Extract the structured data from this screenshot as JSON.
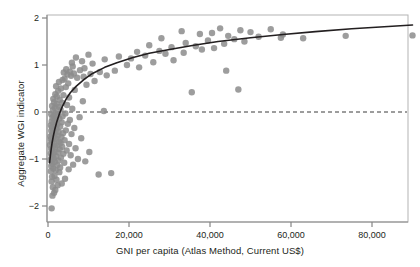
{
  "chart_data": {
    "type": "scatter",
    "title": "",
    "xlabel": "GNI per capita (Atlas Method, Current US$)",
    "ylabel": "Aggregate WGI indicator",
    "xlim": [
      -2500,
      92000
    ],
    "ylim": [
      -2.35,
      2.15
    ],
    "xticks": [
      0,
      20000,
      40000,
      60000,
      80000
    ],
    "xtick_labels": [
      "0",
      "20,000",
      "40,000",
      "60,000",
      "80,000"
    ],
    "yticks": [
      -2,
      -1,
      0,
      1,
      2
    ],
    "ytick_labels": [
      "−2",
      "−1",
      "0",
      "1",
      "2"
    ],
    "grid": false,
    "legend": null,
    "marker_color": "#8c8c8c",
    "marker_size": 3.2,
    "frame_color": "#b3b3b3",
    "reference_lines": [
      {
        "name": "zero-line",
        "orientation": "horizontal",
        "y": 0,
        "style": "dashed",
        "color": "#3a3a3a"
      }
    ],
    "fit_curve": {
      "name": "logarithmic-fit",
      "style": "solid",
      "color": "#231f20",
      "width": 1.6,
      "description": "Logarithmic trend line rising from about -1.05 at low GNI to about 1.85 at 90,000",
      "points": [
        [
          400,
          -1.08
        ],
        [
          600,
          -0.92
        ],
        [
          800,
          -0.78
        ],
        [
          1000,
          -0.66
        ],
        [
          1300,
          -0.52
        ],
        [
          1700,
          -0.36
        ],
        [
          2200,
          -0.2
        ],
        [
          2800,
          -0.04
        ],
        [
          3500,
          0.11
        ],
        [
          4500,
          0.28
        ],
        [
          5500,
          0.41
        ],
        [
          7000,
          0.55
        ],
        [
          9000,
          0.7
        ],
        [
          11000,
          0.82
        ],
        [
          14000,
          0.95
        ],
        [
          17000,
          1.05
        ],
        [
          21000,
          1.16
        ],
        [
          25000,
          1.25
        ],
        [
          30000,
          1.33
        ],
        [
          36000,
          1.42
        ],
        [
          42000,
          1.5
        ],
        [
          50000,
          1.58
        ],
        [
          58000,
          1.65
        ],
        [
          66000,
          1.71
        ],
        [
          75000,
          1.77
        ],
        [
          84000,
          1.82
        ],
        [
          90000,
          1.85
        ]
      ]
    },
    "points": [
      [
        900,
        -2.05
      ],
      [
        1100,
        -1.78
      ],
      [
        1500,
        -1.72
      ],
      [
        1800,
        -1.66
      ],
      [
        1200,
        -1.6
      ],
      [
        2400,
        -1.56
      ],
      [
        3400,
        -1.52
      ],
      [
        900,
        -1.48
      ],
      [
        2100,
        -1.44
      ],
      [
        4200,
        -1.42
      ],
      [
        1000,
        -1.38
      ],
      [
        1600,
        -1.36
      ],
      [
        12500,
        -1.33
      ],
      [
        15600,
        -1.3
      ],
      [
        2800,
        -1.28
      ],
      [
        700,
        -1.26
      ],
      [
        1900,
        -1.24
      ],
      [
        5100,
        -1.22
      ],
      [
        1300,
        -1.2
      ],
      [
        3000,
        -1.18
      ],
      [
        800,
        -1.15
      ],
      [
        2300,
        -1.13
      ],
      [
        6200,
        -1.12
      ],
      [
        1100,
        -1.1
      ],
      [
        4000,
        -1.08
      ],
      [
        1700,
        -1.06
      ],
      [
        9200,
        -1.05
      ],
      [
        2600,
        -1.03
      ],
      [
        600,
        -1.02
      ],
      [
        7400,
        -1.0
      ],
      [
        1400,
        -0.99
      ],
      [
        3200,
        -0.97
      ],
      [
        900,
        -0.95
      ],
      [
        2000,
        -0.94
      ],
      [
        5600,
        -0.92
      ],
      [
        1200,
        -0.9
      ],
      [
        3800,
        -0.89
      ],
      [
        700,
        -0.88
      ],
      [
        2500,
        -0.86
      ],
      [
        10200,
        -0.85
      ],
      [
        1600,
        -0.84
      ],
      [
        4600,
        -0.82
      ],
      [
        1000,
        -0.81
      ],
      [
        2900,
        -0.79
      ],
      [
        800,
        -0.78
      ],
      [
        6800,
        -0.77
      ],
      [
        1800,
        -0.75
      ],
      [
        3500,
        -0.74
      ],
      [
        1300,
        -0.72
      ],
      [
        2200,
        -0.71
      ],
      [
        500,
        -0.7
      ],
      [
        5200,
        -0.68
      ],
      [
        1500,
        -0.67
      ],
      [
        3100,
        -0.66
      ],
      [
        900,
        -0.64
      ],
      [
        2700,
        -0.63
      ],
      [
        1100,
        -0.61
      ],
      [
        4100,
        -0.6
      ],
      [
        700,
        -0.58
      ],
      [
        2000,
        -0.57
      ],
      [
        8200,
        -0.56
      ],
      [
        1400,
        -0.55
      ],
      [
        3300,
        -0.53
      ],
      [
        600,
        -0.52
      ],
      [
        2400,
        -0.5
      ],
      [
        1000,
        -0.49
      ],
      [
        5800,
        -0.47
      ],
      [
        1700,
        -0.46
      ],
      [
        3700,
        -0.45
      ],
      [
        1200,
        -0.43
      ],
      [
        2600,
        -0.42
      ],
      [
        800,
        -0.4
      ],
      [
        4400,
        -0.39
      ],
      [
        1500,
        -0.37
      ],
      [
        2100,
        -0.36
      ],
      [
        6500,
        -0.34
      ],
      [
        1000,
        -0.33
      ],
      [
        3000,
        -0.31
      ],
      [
        1800,
        -0.3
      ],
      [
        700,
        -0.28
      ],
      [
        2300,
        -0.26
      ],
      [
        4900,
        -0.25
      ],
      [
        1300,
        -0.24
      ],
      [
        3400,
        -0.22
      ],
      [
        900,
        -0.2
      ],
      [
        2000,
        -0.19
      ],
      [
        5400,
        -0.17
      ],
      [
        1600,
        -0.16
      ],
      [
        2800,
        -0.14
      ],
      [
        1100,
        -0.12
      ],
      [
        7800,
        -0.11
      ],
      [
        3600,
        -0.09
      ],
      [
        1400,
        -0.08
      ],
      [
        2400,
        -0.06
      ],
      [
        800,
        -0.05
      ],
      [
        4300,
        -0.03
      ],
      [
        1900,
        -0.02
      ],
      [
        13800,
        0.02
      ],
      [
        1200,
        0.04
      ],
      [
        3100,
        0.05
      ],
      [
        6000,
        0.07
      ],
      [
        1700,
        0.09
      ],
      [
        2600,
        0.11
      ],
      [
        1000,
        0.13
      ],
      [
        4700,
        0.15
      ],
      [
        2100,
        0.17
      ],
      [
        3500,
        0.19
      ],
      [
        1500,
        0.21
      ],
      [
        8600,
        0.23
      ],
      [
        2900,
        0.26
      ],
      [
        1300,
        0.28
      ],
      [
        5200,
        0.31
      ],
      [
        2200,
        0.33
      ],
      [
        3800,
        0.36
      ],
      [
        1800,
        0.38
      ],
      [
        35500,
        0.42
      ],
      [
        2500,
        0.45
      ],
      [
        6600,
        0.47
      ],
      [
        47000,
        0.48
      ],
      [
        3200,
        0.5
      ],
      [
        4400,
        0.53
      ],
      [
        2000,
        0.55
      ],
      [
        9500,
        0.58
      ],
      [
        5000,
        0.61
      ],
      [
        2700,
        0.64
      ],
      [
        11500,
        0.66
      ],
      [
        3600,
        0.68
      ],
      [
        4100,
        0.71
      ],
      [
        7200,
        0.73
      ],
      [
        8800,
        0.75
      ],
      [
        5700,
        0.77
      ],
      [
        14500,
        0.78
      ],
      [
        4800,
        0.8
      ],
      [
        10500,
        0.81
      ],
      [
        6400,
        0.82
      ],
      [
        3900,
        0.84
      ],
      [
        12800,
        0.85
      ],
      [
        5400,
        0.86
      ],
      [
        16500,
        0.88
      ],
      [
        44000,
        0.88
      ],
      [
        7900,
        0.89
      ],
      [
        4500,
        0.91
      ],
      [
        9000,
        0.93
      ],
      [
        22500,
        0.95
      ],
      [
        6100,
        0.97
      ],
      [
        19500,
        1.0
      ],
      [
        11000,
        1.03
      ],
      [
        5900,
        1.05
      ],
      [
        26000,
        1.06
      ],
      [
        8400,
        1.08
      ],
      [
        31000,
        1.1
      ],
      [
        14000,
        1.12
      ],
      [
        20500,
        1.14
      ],
      [
        6900,
        1.16
      ],
      [
        17500,
        1.18
      ],
      [
        24000,
        1.2
      ],
      [
        10000,
        1.22
      ],
      [
        29000,
        1.24
      ],
      [
        33500,
        1.26
      ],
      [
        22000,
        1.28
      ],
      [
        27500,
        1.3
      ],
      [
        38000,
        1.33
      ],
      [
        41000,
        1.36
      ],
      [
        30500,
        1.38
      ],
      [
        36500,
        1.4
      ],
      [
        25000,
        1.42
      ],
      [
        43500,
        1.45
      ],
      [
        34000,
        1.47
      ],
      [
        48500,
        1.5
      ],
      [
        39500,
        1.52
      ],
      [
        46000,
        1.55
      ],
      [
        28000,
        1.57
      ],
      [
        52000,
        1.6
      ],
      [
        44500,
        1.62
      ],
      [
        58000,
        1.65
      ],
      [
        37500,
        1.66
      ],
      [
        40500,
        1.68
      ],
      [
        50000,
        1.7
      ],
      [
        33000,
        1.72
      ],
      [
        47500,
        1.74
      ],
      [
        55000,
        1.76
      ],
      [
        42500,
        1.78
      ],
      [
        90000,
        1.63
      ],
      [
        73500,
        1.62
      ],
      [
        57500,
        1.58
      ],
      [
        63000,
        1.57
      ]
    ]
  },
  "geometry": {
    "plot_left": 47,
    "plot_right": 408,
    "plot_top": 15,
    "plot_bottom": 222,
    "x_zero_px": 48,
    "x_per_20000_px": 81,
    "y_zero_px": 112,
    "y_per_unit_px": 47
  }
}
